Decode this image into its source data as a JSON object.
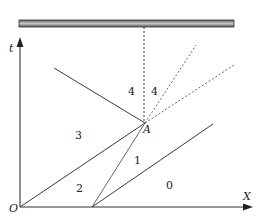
{
  "diagram": {
    "axes": {
      "t_label": "t",
      "x_label": "X",
      "origin_label": "O"
    },
    "point_label": "A",
    "regions": [
      {
        "id": "0",
        "label": "0"
      },
      {
        "id": "1",
        "label": "1"
      },
      {
        "id": "2",
        "label": "2"
      },
      {
        "id": "3",
        "label": "3"
      },
      {
        "id": "4a",
        "label": "4"
      },
      {
        "id": "4b",
        "label": "4"
      }
    ],
    "colors": {
      "line": "#3a3a3a",
      "bar_fill": "#9a9a9a",
      "bar_edge": "#333333"
    }
  }
}
